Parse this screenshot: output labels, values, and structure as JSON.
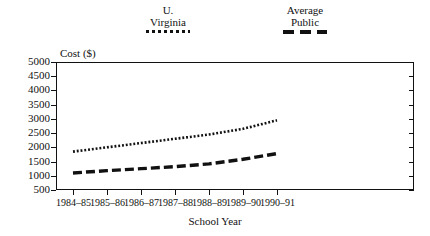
{
  "chart_data": {
    "type": "line",
    "title": "",
    "subtitle": "",
    "xlabel": "School Year",
    "ylabel": "Cost ($)",
    "categories": [
      "1984–85",
      "1985–86",
      "1986–87",
      "1987–88",
      "1988–89",
      "1989–90",
      "1990–91"
    ],
    "series": [
      {
        "name": "U. Virginia",
        "name_line1": "U.",
        "name_line2": "Virginia",
        "style": "dotted",
        "color": "#111111",
        "values": [
          1850,
          2000,
          2150,
          2300,
          2450,
          2650,
          2950
        ]
      },
      {
        "name": "Average Public",
        "name_line1": "Average",
        "name_line2": "Public",
        "style": "dashed",
        "color": "#111111",
        "values": [
          1100,
          1180,
          1250,
          1320,
          1420,
          1580,
          1780
        ]
      }
    ],
    "ylim": [
      500,
      5000
    ],
    "ytick_labels": [
      "5000",
      "4500",
      "4000",
      "3500",
      "3000",
      "2500",
      "2000",
      "1500",
      "1000",
      "500"
    ],
    "ytick_values": [
      5000,
      4500,
      4000,
      3500,
      3000,
      2500,
      2000,
      1500,
      1000,
      500
    ],
    "ytick_interval": 500,
    "grid": false,
    "legend_position": "top",
    "frame": "box",
    "ticks_inside": false,
    "background": "#ffffff"
  },
  "legend": {
    "entries": [
      {
        "line1": "U.",
        "line2": "Virginia",
        "marker": "dotted-line-swatch"
      },
      {
        "line1": "Average",
        "line2": "Public",
        "marker": "dashed-line-swatch"
      }
    ]
  },
  "axes": {
    "y_title": "Cost ($)",
    "x_title": "School Year"
  }
}
